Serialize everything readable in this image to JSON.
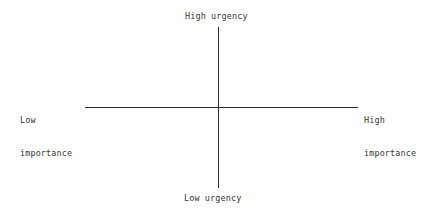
{
  "chart_data": {
    "type": "scatter",
    "title": "",
    "subtitle": "",
    "xlabel": "",
    "ylabel": "",
    "grid": false,
    "legend": null,
    "annotations": [],
    "series": [],
    "axes": {
      "horizontal": {
        "left_label": "Low importance",
        "right_label": "High importance"
      },
      "vertical": {
        "top_label": "High urgency",
        "bottom_label": "Low urgency"
      }
    }
  },
  "labels": {
    "top": "High urgency",
    "bottom": "Low urgency",
    "left_line1": "Low",
    "left_line2": "importance",
    "right_line1": "High",
    "right_line2": "importance"
  },
  "colors": {
    "axis": "#2e2e2e",
    "text": "#3a3a3a",
    "background": "#ffffff"
  }
}
